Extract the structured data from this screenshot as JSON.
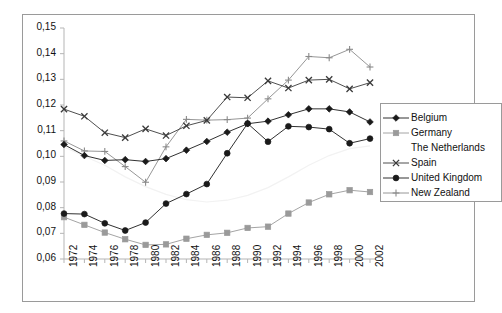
{
  "chart_data": {
    "type": "line",
    "title": "",
    "xlabel": "",
    "ylabel": "",
    "grid": false,
    "legend_position": "right",
    "decimal_separator": ",",
    "x": [
      1972,
      1974,
      1976,
      1978,
      1980,
      1982,
      1984,
      1986,
      1988,
      1990,
      1992,
      1994,
      1996,
      1998,
      2000,
      2002
    ],
    "categories": [
      "1972",
      "1974",
      "1976",
      "1978",
      "1980",
      "1982",
      "1984",
      "1986",
      "1988",
      "1990",
      "1992",
      "1994",
      "1996",
      "1998",
      "2000",
      "2002"
    ],
    "xlim": [
      1972,
      2002
    ],
    "ylim": [
      0.06,
      0.15
    ],
    "ytick_values": [
      0.06,
      0.07,
      0.08,
      0.09,
      0.1,
      0.11,
      0.12,
      0.13,
      0.14,
      0.15
    ],
    "ytick_labels": [
      "0,06",
      "0,07",
      "0,08",
      "0,09",
      "0,10",
      "0,11",
      "0,12",
      "0,13",
      "0,14",
      "0,15"
    ],
    "series": [
      {
        "name": "Belgium",
        "marker": "diamond",
        "color": "#1a1a1a",
        "values": [
          0.1046,
          0.1003,
          0.0984,
          0.0987,
          0.098,
          0.0991,
          0.1024,
          0.1058,
          0.1094,
          0.1127,
          0.1137,
          0.1162,
          0.1185,
          0.1185,
          0.1173,
          0.1134
        ]
      },
      {
        "name": "Germany",
        "marker": "square",
        "color": "#9a9a9a",
        "values": [
          0.0763,
          0.0733,
          0.0703,
          0.0677,
          0.0655,
          0.0657,
          0.0679,
          0.0694,
          0.0702,
          0.0721,
          0.0726,
          0.0777,
          0.082,
          0.0852,
          0.0868,
          0.0861
        ]
      },
      {
        "name": "The Netherlands",
        "marker": "none",
        "color": "#f2f2f2",
        "values": [
          0.1037,
          0.1,
          0.0965,
          0.092,
          0.0882,
          0.0852,
          0.0831,
          0.0822,
          0.0829,
          0.0848,
          0.0878,
          0.092,
          0.0965,
          0.1003,
          0.103,
          0.1041
        ]
      },
      {
        "name": "Spain",
        "marker": "x",
        "color": "#3a3a3a",
        "values": [
          0.1184,
          0.1156,
          0.1092,
          0.1073,
          0.1107,
          0.1081,
          0.1119,
          0.114,
          0.1231,
          0.1228,
          0.1294,
          0.1266,
          0.1297,
          0.13,
          0.1263,
          0.1287
        ]
      },
      {
        "name": "United Kingdom",
        "marker": "circle",
        "color": "#1a1a1a",
        "values": [
          0.0777,
          0.0775,
          0.0739,
          0.0711,
          0.0742,
          0.0816,
          0.0853,
          0.0892,
          0.1012,
          0.1128,
          0.1057,
          0.1117,
          0.1114,
          0.1106,
          0.1051,
          0.1069
        ]
      },
      {
        "name": "New Zealand",
        "marker": "plus",
        "color": "#8a8a8a",
        "values": [
          0.106,
          0.1021,
          0.1019,
          0.096,
          0.0899,
          0.1037,
          0.1144,
          0.1141,
          0.1143,
          0.1149,
          0.1224,
          0.1297,
          0.1389,
          0.1384,
          0.1417,
          0.1348
        ]
      }
    ]
  },
  "legend": {
    "items": [
      {
        "label": "Belgium"
      },
      {
        "label": "Germany"
      },
      {
        "label": "The Netherlands"
      },
      {
        "label": "Spain"
      },
      {
        "label": "United Kingdom"
      },
      {
        "label": "New Zealand"
      }
    ]
  }
}
